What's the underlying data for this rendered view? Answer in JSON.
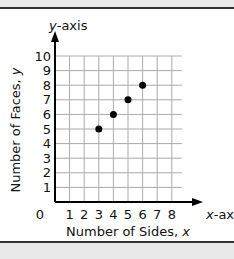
{
  "chart_data": {
    "type": "scatter",
    "title": "",
    "xlabel": "Number of Sides, x",
    "ylabel": "Number of Faces, y",
    "x_axis_name": "x-axis",
    "y_axis_name": "y-axis",
    "x_ticks": [
      "0",
      "1",
      "2",
      "3",
      "4",
      "5",
      "6",
      "7",
      "8"
    ],
    "y_ticks": [
      "1",
      "2",
      "3",
      "4",
      "5",
      "6",
      "7",
      "8",
      "9",
      "10"
    ],
    "xlim": [
      0,
      8
    ],
    "ylim": [
      0,
      10
    ],
    "grid": true,
    "series": [
      {
        "name": "points",
        "x": [
          3,
          4,
          5,
          6
        ],
        "y": [
          5,
          6,
          7,
          8
        ]
      }
    ],
    "colors": {
      "points": "#000000",
      "grid": "#aaaaaa",
      "axis": "#000000"
    }
  },
  "labels": {
    "y_axis_name_italic": "y",
    "y_axis_name_rest": "-axis",
    "x_axis_name_italic": "x",
    "x_axis_name_rest": "-axis",
    "xlabel_text": "Number of Sides, ",
    "xlabel_var": "x",
    "ylabel_text": "Number of Faces, ",
    "ylabel_var": "y",
    "origin": "0"
  }
}
